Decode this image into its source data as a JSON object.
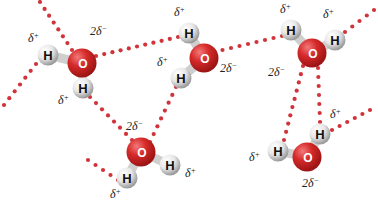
{
  "colors": {
    "oxygen": "#d62a2a",
    "oxygen_highlight": "#f27a7a",
    "oxygen_shadow": "#9c1414",
    "hydrogen": "#e6e6e6",
    "hydrogen_highlight": "#ffffff",
    "hydrogen_shadow": "#9a9a9a",
    "bond_dots": "#d0343a",
    "label_text": "#222222",
    "oxygen_symbol": "#ffffff",
    "hydrogen_symbol": "#111111"
  },
  "symbols": {
    "oxygen": "O",
    "hydrogen": "H"
  },
  "molecules": [
    {
      "id": "water-1",
      "oxygen": {
        "x": 82,
        "y": 63
      },
      "hydrogens": [
        {
          "x": 48,
          "y": 55
        },
        {
          "x": 83,
          "y": 88
        }
      ],
      "charges": [
        {
          "text": "δ+",
          "x": 28,
          "y": 42
        },
        {
          "text": "2δ−",
          "x": 90,
          "y": 35
        },
        {
          "text": "δ+",
          "x": 58,
          "y": 104
        }
      ]
    },
    {
      "id": "water-2",
      "oxygen": {
        "x": 204,
        "y": 58
      },
      "hydrogens": [
        {
          "x": 189,
          "y": 33
        },
        {
          "x": 181,
          "y": 78
        }
      ],
      "charges": [
        {
          "text": "δ+",
          "x": 174,
          "y": 16
        },
        {
          "text": "δ+",
          "x": 157,
          "y": 66
        },
        {
          "text": "2δ−",
          "x": 220,
          "y": 72
        }
      ]
    },
    {
      "id": "water-3",
      "oxygen": {
        "x": 312,
        "y": 53
      },
      "hydrogens": [
        {
          "x": 291,
          "y": 30
        },
        {
          "x": 335,
          "y": 40
        }
      ],
      "charges": [
        {
          "text": "δ+",
          "x": 280,
          "y": 13
        },
        {
          "text": "δ+",
          "x": 323,
          "y": 18
        },
        {
          "text": "2δ−",
          "x": 268,
          "y": 76
        }
      ]
    },
    {
      "id": "water-4",
      "oxygen": {
        "x": 141,
        "y": 152
      },
      "hydrogens": [
        {
          "x": 127,
          "y": 178
        },
        {
          "x": 170,
          "y": 165
        }
      ],
      "charges": [
        {
          "text": "2δ−",
          "x": 126,
          "y": 130
        },
        {
          "text": "δ+",
          "x": 185,
          "y": 177
        },
        {
          "text": "δ+",
          "x": 110,
          "y": 198
        }
      ]
    },
    {
      "id": "water-5",
      "oxygen": {
        "x": 307,
        "y": 157
      },
      "hydrogens": [
        {
          "x": 278,
          "y": 151
        },
        {
          "x": 320,
          "y": 134
        }
      ],
      "charges": [
        {
          "text": "δ+",
          "x": 249,
          "y": 161
        },
        {
          "text": "δ+",
          "x": 330,
          "y": 118
        },
        {
          "text": "2δ−",
          "x": 302,
          "y": 187
        }
      ]
    }
  ],
  "hydrogen_bonds": [
    {
      "from": [
        40,
        2
      ],
      "to": [
        72,
        50
      ]
    },
    {
      "from": [
        4,
        105
      ],
      "to": [
        36,
        64
      ]
    },
    {
      "from": [
        96,
        56
      ],
      "to": [
        178,
        37
      ]
    },
    {
      "from": [
        90,
        97
      ],
      "to": [
        132,
        140
      ]
    },
    {
      "from": [
        176,
        87
      ],
      "to": [
        150,
        142
      ]
    },
    {
      "from": [
        214,
        52
      ],
      "to": [
        282,
        36
      ]
    },
    {
      "from": [
        345,
        32
      ],
      "to": [
        374,
        10
      ]
    },
    {
      "from": [
        88,
        160
      ],
      "to": [
        118,
        180
      ]
    },
    {
      "from": [
        303,
        66
      ],
      "to": [
        284,
        140
      ]
    },
    {
      "from": [
        318,
        68
      ],
      "to": [
        320,
        122
      ]
    },
    {
      "from": [
        332,
        130
      ],
      "to": [
        370,
        110
      ]
    }
  ]
}
